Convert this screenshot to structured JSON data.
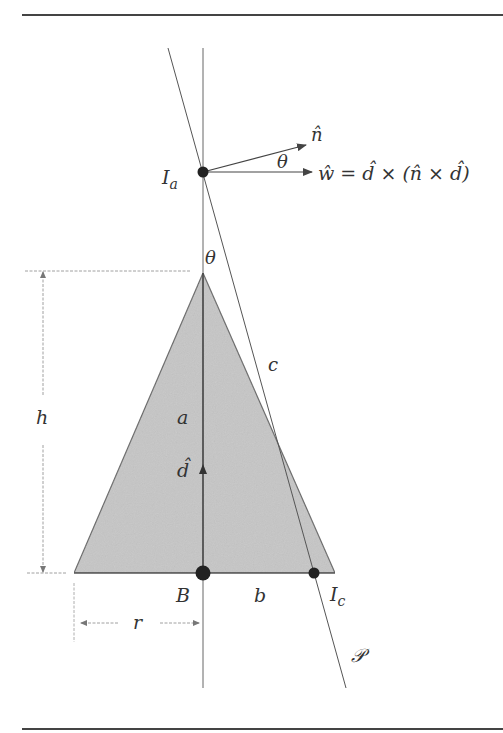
{
  "figure": {
    "labels": {
      "I_a_main": "I",
      "I_a_sub": "a",
      "n_hat": "n̂",
      "theta_top": "θ",
      "w_eq_w": "ŵ",
      "w_eq_rest": " = d̂ × (n̂ × d̂)",
      "theta_apex": "θ",
      "c": "c",
      "h": "h",
      "a": "a",
      "d_hat": "d̂",
      "B": "B",
      "b": "b",
      "I_c_main": "I",
      "I_c_sub": "c",
      "r": "r",
      "P": "𝒫"
    },
    "colors": {
      "cone_fill": "#c8c8c8",
      "line": "#555555",
      "text": "#333333",
      "rule": "#444444"
    },
    "points": {
      "I_a": [
        203,
        172
      ],
      "apex": [
        203,
        273
      ],
      "B": [
        203,
        573
      ],
      "I_c": [
        314,
        573
      ]
    }
  }
}
